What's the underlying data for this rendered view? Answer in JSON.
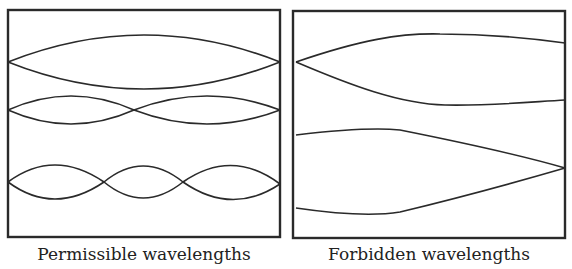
{
  "panels": [
    {
      "caption": "Permissible wavelengths",
      "description": "Standing waves with nodes at both walls (1, 2 and 3 half-wavelengths)"
    },
    {
      "caption": "Forbidden wavelengths",
      "description": "Waves whose nodes do not coincide with both walls"
    }
  ],
  "colors": {
    "stroke": "#2a2a2a",
    "background": "#ffffff"
  }
}
